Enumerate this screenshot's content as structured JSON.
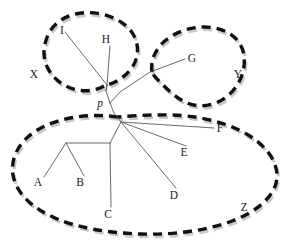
{
  "figure": {
    "background_color": "#ffffff",
    "width": 293,
    "height": 248
  },
  "style": {
    "blob_stroke_color": "#111111",
    "blob_shadow_color": "#c9c9c9",
    "branch_color": "#58585a",
    "label_color": "#1a1a1a"
  },
  "internal_nodes": [
    {
      "id": "p",
      "label": "p",
      "x": 110,
      "y": 103,
      "italic": true
    }
  ],
  "leaves": [
    {
      "id": "A",
      "label": "A",
      "label_x": 38,
      "label_y": 186,
      "tip_x": 44,
      "tip_y": 177,
      "group": "Z"
    },
    {
      "id": "B",
      "label": "B",
      "label_x": 80,
      "label_y": 186,
      "tip_x": 84,
      "tip_y": 176,
      "group": "Z"
    },
    {
      "id": "C",
      "label": "C",
      "label_x": 108,
      "label_y": 218,
      "tip_x": 111,
      "tip_y": 207,
      "group": "Z"
    },
    {
      "id": "D",
      "label": "D",
      "label_x": 174,
      "label_y": 199,
      "tip_x": 176,
      "tip_y": 188,
      "group": "Z"
    },
    {
      "id": "E",
      "label": "E",
      "label_x": 184,
      "label_y": 156,
      "tip_x": 186,
      "tip_y": 146,
      "group": "Z"
    },
    {
      "id": "F",
      "label": "F",
      "label_x": 218,
      "label_y": 132,
      "tip_x": 214,
      "tip_y": 128,
      "group": "Z"
    },
    {
      "id": "G",
      "label": "G",
      "label_x": 190,
      "label_y": 62,
      "tip_x": 185,
      "tip_y": 59,
      "group": "Y"
    },
    {
      "id": "H",
      "label": "H",
      "label_x": 106,
      "label_y": 43,
      "tip_x": 110,
      "tip_y": 46,
      "group": "X"
    },
    {
      "id": "I",
      "label": "I",
      "label_x": 62,
      "label_y": 34,
      "tip_x": 65,
      "tip_y": 32,
      "group": "X"
    }
  ],
  "groups": [
    {
      "id": "X",
      "label": "X",
      "label_x": 34,
      "label_y": 78,
      "members": [
        "I",
        "H"
      ]
    },
    {
      "id": "Y",
      "label": "Y",
      "label_x": 238,
      "label_y": 78,
      "members": [
        "G"
      ]
    },
    {
      "id": "Z",
      "label": "Z",
      "label_x": 244,
      "label_y": 211,
      "members": [
        "A",
        "B",
        "C",
        "D",
        "E",
        "F"
      ]
    }
  ],
  "branches": [
    {
      "from": "p",
      "to": "xnode"
    },
    {
      "from": "xnode",
      "to": "I"
    },
    {
      "from": "xnode",
      "to": "H"
    },
    {
      "from": "p",
      "to": "G"
    },
    {
      "from": "p",
      "to": "znode"
    },
    {
      "from": "znode",
      "to": "F"
    },
    {
      "from": "znode",
      "to": "E"
    },
    {
      "from": "znode",
      "to": "D"
    },
    {
      "from": "znode",
      "to": "cnode"
    },
    {
      "from": "cnode",
      "to": "C"
    },
    {
      "from": "cnode",
      "to": "abnode"
    },
    {
      "from": "abnode",
      "to": "A"
    },
    {
      "from": "abnode",
      "to": "B"
    }
  ],
  "paths": {
    "tree": "M 106 91 L 107 85 M 107 85 L 65 32 M 107 85 L 110 46 M 110 103 L 120 92 L 150 72 L 185 59 M 110 103 L 114 113 L 121 122 M 121 122 L 214 128 M 121 122 L 186 146 M 121 122 L 176 188 M 121 122 L 110 143 M 110 143 L 111 207 M 110 143 L 66 143 M 66 143 L 44 177 M 66 143 L 84 176",
    "tree_top_link": "M 110 103 L 106 91 L 107 85",
    "blob_x": "M 104 86 C 92 93 76 92 64 85 C 52 78 44 66 44 53 C 44 40 50 27 61 20 C 72 13 87 11 101 14 C 115 17 127 24 133 34 C 139 44 139 56 133 66 C 127 76 116 83 104 86 Z",
    "blob_y": "M 152 72 C 150 60 156 48 166 40 C 176 32 190 27 204 27 C 218 27 231 32 238 41 C 245 50 246 63 242 75 C 238 87 229 97 218 102 C 207 107 195 107 185 102 C 175 97 167 89 160 82 C 156 78 153 75 152 72 Z",
    "blob_z": "M 118 117 C 90 113 62 117 41 128 C 20 139 10 157 13 175 C 16 193 32 208 55 218 C 78 228 108 233 140 234 C 172 235 205 231 232 221 C 259 211 277 194 277 176 C 277 158 262 141 239 130 C 216 119 187 114 158 115 C 144 115 130 116 118 117 Z"
  }
}
